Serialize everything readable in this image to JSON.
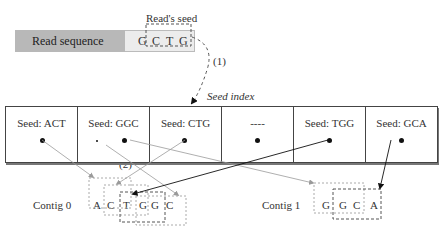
{
  "read": {
    "label": "Read sequence",
    "letters": [
      "G",
      "C",
      "T",
      "G"
    ],
    "seed_label": "Read's seed"
  },
  "step_labels": {
    "step1": "(1)",
    "step2": "(2)"
  },
  "seed_index": {
    "title": "Seed index",
    "cells": [
      {
        "label": "Seed: ACT"
      },
      {
        "label": "Seed: GGC"
      },
      {
        "label": "Seed: CTG"
      },
      {
        "label": "----"
      },
      {
        "label": "Seed: TGG"
      },
      {
        "label": "Seed: GCA"
      }
    ]
  },
  "contigs": [
    {
      "label": "Contig 0",
      "letters": [
        "A",
        "C",
        "T",
        "G",
        "G",
        "C"
      ]
    },
    {
      "label": "Contig 1",
      "letters": [
        "G",
        "G",
        "C",
        "A"
      ]
    }
  ],
  "colors": {
    "grey_arrow": "#9a9a9a",
    "black_arrow": "#111111",
    "read_label_bg": "#b8b8b8"
  }
}
